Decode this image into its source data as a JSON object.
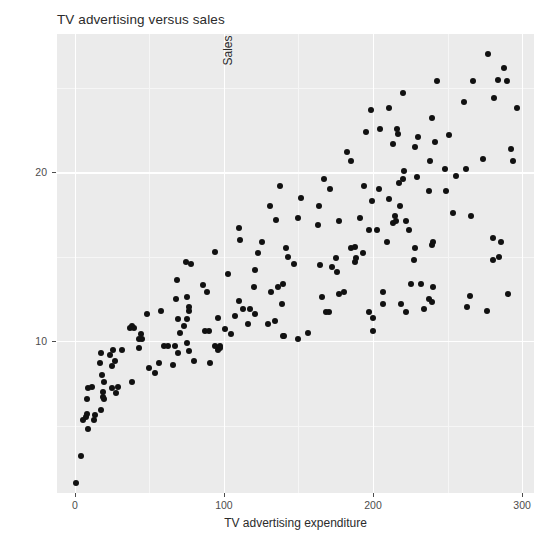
{
  "chart_data": {
    "type": "scatter",
    "title": "TV advertising versus sales",
    "xlabel": "TV advertising expenditure",
    "ylabel": "Sales",
    "xlim": [
      -12,
      308
    ],
    "ylim": [
      1.0,
      28.2
    ],
    "xticks": [
      0,
      100,
      200,
      300
    ],
    "xtick_labels": [
      "0",
      "100",
      "200",
      "300"
    ],
    "yticks": [
      10,
      20
    ],
    "ytick_labels": [
      "10",
      "20"
    ],
    "x_minor_ticks": [
      50,
      150,
      250
    ],
    "y_minor_ticks": [
      5,
      15,
      25
    ],
    "grid": true,
    "legend": null,
    "panel_background": "#ebebeb",
    "grid_color": "#ffffff",
    "point_color": "#111111",
    "point_size": 6,
    "n_points": 130,
    "points": [
      [
        230.1,
        22.1
      ],
      [
        44.5,
        10.4
      ],
      [
        17.2,
        9.3
      ],
      [
        151.5,
        18.5
      ],
      [
        180.8,
        12.9
      ],
      [
        8.7,
        7.2
      ],
      [
        57.5,
        11.8
      ],
      [
        120.2,
        13.2
      ],
      [
        8.6,
        4.8
      ],
      [
        199.8,
        10.6
      ],
      [
        66.1,
        8.6
      ],
      [
        214.7,
        17.4
      ],
      [
        23.8,
        9.2
      ],
      [
        97.5,
        9.7
      ],
      [
        204.1,
        19.0
      ],
      [
        195.4,
        22.4
      ],
      [
        67.8,
        12.5
      ],
      [
        281.4,
        24.4
      ],
      [
        69.2,
        11.3
      ],
      [
        147.3,
        14.6
      ],
      [
        218.4,
        18.0
      ],
      [
        237.4,
        12.5
      ],
      [
        13.2,
        5.6
      ],
      [
        228.3,
        15.5
      ],
      [
        62.3,
        9.7
      ],
      [
        262.9,
        12.0
      ],
      [
        142.9,
        15.0
      ],
      [
        240.1,
        15.9
      ],
      [
        248.8,
        18.9
      ],
      [
        70.6,
        10.5
      ],
      [
        292.9,
        21.4
      ],
      [
        112.9,
        11.9
      ],
      [
        97.2,
        9.6
      ],
      [
        265.6,
        17.4
      ],
      [
        95.7,
        9.5
      ],
      [
        290.7,
        12.8
      ],
      [
        266.9,
        25.4
      ],
      [
        74.7,
        14.7
      ],
      [
        43.1,
        10.1
      ],
      [
        228.0,
        21.5
      ],
      [
        202.5,
        16.6
      ],
      [
        177.0,
        17.1
      ],
      [
        293.6,
        20.7
      ],
      [
        206.9,
        12.9
      ],
      [
        25.1,
        8.5
      ],
      [
        175.1,
        14.9
      ],
      [
        89.7,
        10.6
      ],
      [
        239.9,
        23.2
      ],
      [
        227.2,
        14.8
      ],
      [
        66.9,
        9.7
      ],
      [
        199.8,
        11.4
      ],
      [
        100.4,
        10.7
      ],
      [
        216.4,
        22.6
      ],
      [
        182.6,
        21.2
      ],
      [
        262.7,
        20.2
      ],
      [
        198.9,
        23.7
      ],
      [
        7.3,
        5.5
      ],
      [
        136.2,
        13.2
      ],
      [
        210.8,
        23.8
      ],
      [
        210.7,
        18.4
      ],
      [
        53.5,
        8.1
      ],
      [
        261.3,
        24.2
      ],
      [
        239.3,
        15.7
      ],
      [
        102.7,
        14.0
      ],
      [
        131.1,
        18.0
      ],
      [
        69.0,
        9.3
      ],
      [
        31.5,
        9.5
      ],
      [
        139.3,
        13.4
      ],
      [
        237.4,
        18.9
      ],
      [
        216.8,
        22.3
      ],
      [
        199.1,
        18.3
      ],
      [
        109.8,
        12.4
      ],
      [
        26.8,
        8.8
      ],
      [
        129.4,
        11.0
      ],
      [
        213.4,
        17.0
      ],
      [
        16.9,
        8.7
      ],
      [
        27.5,
        6.9
      ],
      [
        120.5,
        14.2
      ],
      [
        5.4,
        5.3
      ],
      [
        116.0,
        11.0
      ],
      [
        76.4,
        11.8
      ],
      [
        239.8,
        12.3
      ],
      [
        75.3,
        11.3
      ],
      [
        68.4,
        13.6
      ],
      [
        213.5,
        21.7
      ],
      [
        193.2,
        15.2
      ],
      [
        76.3,
        12.0
      ],
      [
        110.7,
        16.0
      ],
      [
        88.3,
        12.9
      ],
      [
        109.8,
        16.7
      ],
      [
        134.3,
        11.2
      ],
      [
        28.6,
        7.3
      ],
      [
        217.7,
        19.4
      ],
      [
        250.9,
        22.2
      ],
      [
        107.4,
        11.5
      ],
      [
        163.3,
        16.9
      ],
      [
        197.6,
        11.7
      ],
      [
        184.9,
        15.5
      ],
      [
        289.7,
        25.4
      ],
      [
        135.2,
        17.2
      ],
      [
        222.4,
        11.7
      ],
      [
        296.4,
        23.8
      ],
      [
        280.2,
        14.8
      ],
      [
        187.9,
        14.7
      ],
      [
        238.2,
        20.7
      ],
      [
        137.9,
        19.2
      ],
      [
        25.0,
        7.2
      ],
      [
        90.4,
        8.7
      ],
      [
        13.1,
        5.3
      ],
      [
        255.4,
        19.8
      ],
      [
        225.8,
        13.4
      ],
      [
        241.7,
        21.8
      ],
      [
        175.7,
        14.1
      ],
      [
        209.6,
        15.9
      ],
      [
        78.2,
        14.6
      ],
      [
        75.1,
        12.6
      ],
      [
        139.2,
        12.2
      ],
      [
        76.4,
        9.4
      ],
      [
        125.7,
        15.9
      ],
      [
        19.4,
        6.6
      ],
      [
        141.3,
        15.5
      ],
      [
        18.8,
        7.0
      ],
      [
        224.0,
        16.6
      ],
      [
        123.1,
        15.2
      ],
      [
        229.5,
        19.7
      ],
      [
        87.2,
        10.6
      ],
      [
        7.8,
        6.6
      ],
      [
        80.2,
        8.8
      ],
      [
        220.3,
        24.7
      ],
      [
        59.6,
        9.7
      ],
      [
        0.7,
        1.6
      ],
      [
        265.2,
        12.7
      ],
      [
        8.4,
        5.7
      ],
      [
        219.8,
        19.6
      ],
      [
        36.9,
        10.8
      ],
      [
        48.3,
        11.6
      ],
      [
        25.6,
        9.5
      ],
      [
        273.7,
        20.8
      ],
      [
        43.0,
        9.6
      ],
      [
        184.9,
        20.7
      ],
      [
        73.4,
        10.9
      ],
      [
        193.7,
        19.2
      ],
      [
        220.5,
        20.1
      ],
      [
        104.6,
        10.4
      ],
      [
        96.2,
        11.4
      ],
      [
        140.3,
        10.3
      ],
      [
        240.1,
        13.2
      ],
      [
        243.2,
        25.4
      ],
      [
        38.0,
        10.9
      ],
      [
        44.7,
        10.1
      ],
      [
        280.7,
        16.1
      ],
      [
        121.0,
        11.6
      ],
      [
        197.6,
        16.6
      ],
      [
        171.3,
        19.0
      ],
      [
        187.8,
        15.6
      ],
      [
        4.1,
        3.2
      ],
      [
        93.9,
        15.3
      ],
      [
        149.8,
        10.1
      ],
      [
        11.7,
        7.3
      ],
      [
        131.7,
        12.9
      ],
      [
        172.5,
        14.4
      ],
      [
        85.7,
        13.3
      ],
      [
        188.4,
        14.9
      ],
      [
        163.5,
        18.0
      ],
      [
        117.2,
        11.9
      ],
      [
        234.5,
        11.9
      ],
      [
        17.9,
        8.0
      ],
      [
        206.8,
        12.2
      ],
      [
        215.4,
        17.1
      ],
      [
        284.3,
        15.0
      ],
      [
        50.0,
        8.4
      ],
      [
        164.5,
        14.5
      ],
      [
        19.6,
        7.6
      ],
      [
        168.4,
        11.7
      ],
      [
        222.4,
        17.1
      ],
      [
        276.9,
        27.0
      ],
      [
        248.4,
        20.2
      ],
      [
        170.2,
        11.7
      ],
      [
        276.7,
        11.8
      ],
      [
        165.6,
        12.6
      ],
      [
        156.6,
        10.5
      ],
      [
        218.5,
        12.2
      ],
      [
        56.2,
        8.7
      ],
      [
        287.6,
        26.2
      ],
      [
        253.8,
        17.6
      ],
      [
        205.0,
        22.6
      ],
      [
        139.5,
        10.3
      ],
      [
        191.1,
        17.3
      ],
      [
        286.0,
        15.9
      ],
      [
        18.7,
        6.7
      ],
      [
        39.5,
        10.8
      ],
      [
        75.5,
        9.9
      ],
      [
        17.2,
        5.9
      ],
      [
        166.8,
        19.6
      ],
      [
        149.7,
        17.3
      ],
      [
        38.2,
        7.6
      ],
      [
        94.2,
        9.7
      ],
      [
        177.0,
        12.8
      ],
      [
        283.6,
        25.5
      ],
      [
        232.1,
        13.4
      ]
    ]
  }
}
